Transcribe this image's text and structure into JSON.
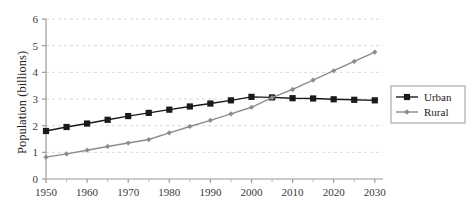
{
  "chart_data": {
    "type": "line",
    "title": "",
    "xlabel": "",
    "ylabel": "Population (billions)",
    "xlim": [
      1950,
      2032
    ],
    "ylim": [
      0,
      6
    ],
    "grid": "horizontal-dashed",
    "legend_position": "right",
    "x": [
      1950,
      1955,
      1960,
      1965,
      1970,
      1975,
      1980,
      1985,
      1990,
      1995,
      2000,
      2005,
      2010,
      2015,
      2020,
      2025,
      2030
    ],
    "xticks": [
      1950,
      1960,
      1970,
      1980,
      1990,
      2000,
      2010,
      2020,
      2030
    ],
    "xtick_labels": [
      "1950",
      "1960",
      "1970",
      "1980",
      "1990",
      "2000",
      "2010",
      "2020",
      "2030"
    ],
    "xminor_ticks": [
      1955,
      1965,
      1975,
      1985,
      1995,
      2005,
      2015,
      2025
    ],
    "yticks": [
      0,
      1,
      2,
      3,
      4,
      5,
      6
    ],
    "ytick_labels": [
      "0",
      "1",
      "2",
      "3",
      "4",
      "5",
      "6"
    ],
    "series": [
      {
        "name": "Urban",
        "color": "#1a1a1a",
        "marker": "square",
        "values": [
          1.8,
          1.95,
          2.08,
          2.22,
          2.36,
          2.48,
          2.6,
          2.72,
          2.83,
          2.95,
          3.08,
          3.06,
          3.03,
          3.02,
          2.99,
          2.97,
          2.95
        ]
      },
      {
        "name": "Rural",
        "color": "#8c8c8c",
        "marker": "diamond",
        "values": [
          0.82,
          0.94,
          1.08,
          1.22,
          1.35,
          1.48,
          1.73,
          1.97,
          2.2,
          2.44,
          2.69,
          3.05,
          3.36,
          3.71,
          4.06,
          4.41,
          4.76
        ]
      }
    ]
  },
  "legend": {
    "items": [
      {
        "label": "Urban"
      },
      {
        "label": "Rural"
      }
    ]
  }
}
